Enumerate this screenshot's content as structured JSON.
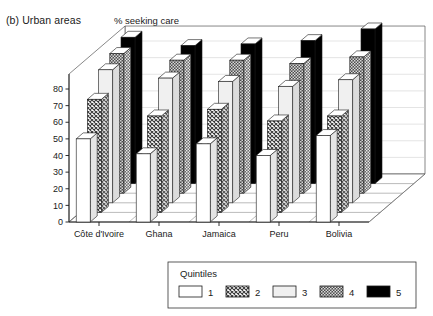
{
  "figure": {
    "panel_label": "(b) Urban areas",
    "axis_title": "% seeking care"
  },
  "legend": {
    "title": "Quintiles",
    "items": [
      {
        "label": "1",
        "fill": "#ffffff",
        "pattern": "solid-white"
      },
      {
        "label": "2",
        "fill": "#9a9a9a",
        "pattern": "crosshatch-medium"
      },
      {
        "label": "3",
        "fill": "#ededed",
        "pattern": "solid-light"
      },
      {
        "label": "4",
        "fill": "#777777",
        "pattern": "dots-dark"
      },
      {
        "label": "5",
        "fill": "#000000",
        "pattern": "solid-black"
      }
    ]
  },
  "chart_data": {
    "type": "bar",
    "title": "(b) Urban areas",
    "xlabel": "",
    "ylabel": "% seeking care",
    "ylim": [
      0,
      80
    ],
    "yticks": [
      0,
      10,
      20,
      30,
      40,
      50,
      60,
      70,
      80
    ],
    "grid": true,
    "legend_position": "bottom",
    "projection": "3d",
    "categories": [
      "Côte d'Ivoire",
      "Ghana",
      "Jamaica",
      "Peru",
      "Bolivia"
    ],
    "series": [
      {
        "name": "1",
        "values": [
          50,
          41,
          47,
          40,
          52
        ]
      },
      {
        "name": "2",
        "values": [
          68,
          58,
          62,
          55,
          58
        ]
      },
      {
        "name": "3",
        "values": [
          80,
          75,
          73,
          70,
          74
        ]
      },
      {
        "name": "4",
        "values": [
          84,
          80,
          80,
          78,
          82
        ]
      },
      {
        "name": "5",
        "values": [
          88,
          83,
          84,
          86,
          93
        ]
      }
    ]
  }
}
